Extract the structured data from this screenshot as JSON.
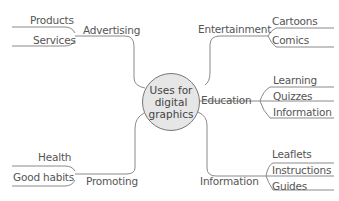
{
  "center": {
    "line1": "Uses for",
    "line2": "digital",
    "line3": "graphics"
  },
  "branches": {
    "advertising": {
      "label": "Advertising",
      "children": [
        "Products",
        "Services"
      ]
    },
    "entertainment": {
      "label": "Entertainment",
      "children": [
        "Cartoons",
        "Comics"
      ]
    },
    "education": {
      "label": "Education",
      "children": [
        "Learning",
        "Quizzes",
        "Information"
      ]
    },
    "information": {
      "label": "Information",
      "children": [
        "Leaflets",
        "Instructions",
        "Guides"
      ]
    },
    "promoting": {
      "label": "Promoting",
      "children": [
        "Health",
        "Good habits"
      ]
    }
  },
  "colors": {
    "line": "#8a8a8a",
    "text": "#555555",
    "center_fill": "#e6e6e6"
  }
}
